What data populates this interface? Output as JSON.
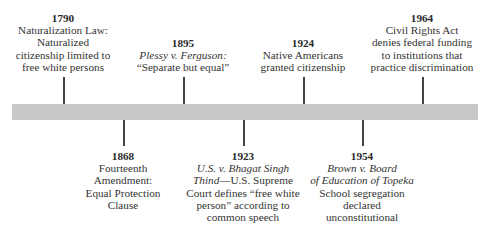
{
  "timeline": {
    "bar_color": "#c8c8c8",
    "events_above": [
      {
        "year": "1790",
        "lines": [
          {
            "text": "Naturalization Law:",
            "italic": false
          },
          {
            "text": "Naturalized",
            "italic": false
          },
          {
            "text": "citizenship limited to",
            "italic": false
          },
          {
            "text": "free white persons",
            "italic": false
          }
        ]
      },
      {
        "year": "1895",
        "lines": [
          {
            "text": "Plessy v. Ferguson:",
            "italic": true
          },
          {
            "text": "“Separate but equal”",
            "italic": false
          }
        ]
      },
      {
        "year": "1924",
        "lines": [
          {
            "text": "Native Americans",
            "italic": false
          },
          {
            "text": "granted citizenship",
            "italic": false
          }
        ]
      },
      {
        "year": "1964",
        "lines": [
          {
            "text": "Civil Rights Act",
            "italic": false
          },
          {
            "text": "denies federal funding",
            "italic": false
          },
          {
            "text": "to institutions that",
            "italic": false
          },
          {
            "text": "practice discrimination",
            "italic": false
          }
        ]
      }
    ],
    "events_below": [
      {
        "year": "1868",
        "lines": [
          {
            "text": "Fourteenth",
            "italic": false
          },
          {
            "text": "Amendment:",
            "italic": false
          },
          {
            "text": "Equal Protection",
            "italic": false
          },
          {
            "text": "Clause",
            "italic": false
          }
        ]
      },
      {
        "year": "1923",
        "lines": [
          {
            "text": "U.S. v. Bhagat Singh",
            "italic": true
          },
          {
            "text": "Thind",
            "italic": true,
            "suffix": "—U.S. Supreme"
          },
          {
            "text": "Court defines “free white",
            "italic": false
          },
          {
            "text": "person” according to",
            "italic": false
          },
          {
            "text": "common speech",
            "italic": false
          }
        ]
      },
      {
        "year": "1954",
        "lines": [
          {
            "text": "Brown v. Board",
            "italic": true
          },
          {
            "text": "of Education of Topeka",
            "italic": true
          },
          {
            "text": "School segregation",
            "italic": false
          },
          {
            "text": "declared",
            "italic": false
          },
          {
            "text": "unconstitutional",
            "italic": false
          }
        ]
      }
    ]
  }
}
